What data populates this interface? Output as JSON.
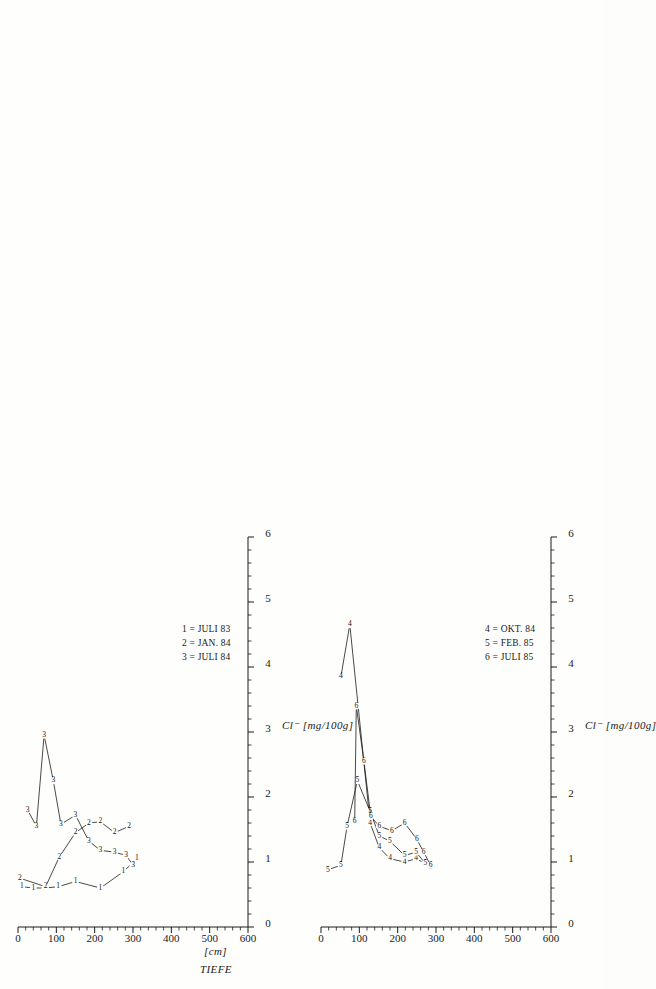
{
  "figure": {
    "orientation": "rotated-90-ccw",
    "background": "#fefefc",
    "ink": "#1a1a1a"
  },
  "axes_common": {
    "y_title": "TIEFE",
    "y_unit": "[cm]",
    "y_ticks": [
      "0",
      "100",
      "200",
      "300",
      "400",
      "500",
      "600"
    ],
    "y_min": 0,
    "y_max": 600,
    "x_title": "Cl⁻  [mg/100g]",
    "x_ticks": [
      "0",
      "1",
      "2",
      "3",
      "4",
      "5",
      "6"
    ],
    "x_min": 0,
    "x_max": 6
  },
  "chart_data": [
    {
      "id": "left",
      "type": "line",
      "title": "",
      "xlabel": "Cl⁻  [mg/100g]",
      "ylabel": "TIEFE [cm]",
      "xlim": [
        0,
        6
      ],
      "ylim": [
        0,
        600
      ],
      "y_inverted": true,
      "grid": false,
      "legend_position": "bottom-right",
      "legend": [
        {
          "key": "1",
          "label": "1 = JULI 83"
        },
        {
          "key": "2",
          "label": "2 = JAN. 84"
        },
        {
          "key": "3",
          "label": "3 = JULI 84"
        }
      ],
      "series": [
        {
          "name": "1 = JULI 83",
          "marker": "1",
          "points": [
            {
              "x": 0.62,
              "y": 10
            },
            {
              "x": 0.6,
              "y": 40
            },
            {
              "x": 0.6,
              "y": 70
            },
            {
              "x": 0.62,
              "y": 105
            },
            {
              "x": 0.7,
              "y": 150
            },
            {
              "x": 0.6,
              "y": 215
            },
            {
              "x": 0.85,
              "y": 275
            },
            {
              "x": 1.05,
              "y": 310
            }
          ]
        },
        {
          "name": "2 = JAN. 84",
          "marker": "2",
          "points": [
            {
              "x": 0.75,
              "y": 5
            },
            {
              "x": 0.62,
              "y": 72
            },
            {
              "x": 1.08,
              "y": 108
            },
            {
              "x": 1.45,
              "y": 150
            },
            {
              "x": 1.6,
              "y": 185
            },
            {
              "x": 1.62,
              "y": 215
            },
            {
              "x": 1.45,
              "y": 252
            },
            {
              "x": 1.55,
              "y": 290
            }
          ]
        },
        {
          "name": "3 = JULI 84",
          "marker": "3",
          "points": [
            {
              "x": 1.8,
              "y": 25
            },
            {
              "x": 1.55,
              "y": 48
            },
            {
              "x": 2.95,
              "y": 68
            },
            {
              "x": 2.25,
              "y": 92
            },
            {
              "x": 1.58,
              "y": 112
            },
            {
              "x": 1.72,
              "y": 150
            },
            {
              "x": 1.32,
              "y": 185
            },
            {
              "x": 1.18,
              "y": 215
            },
            {
              "x": 1.15,
              "y": 252
            },
            {
              "x": 1.1,
              "y": 282
            },
            {
              "x": 0.95,
              "y": 300
            }
          ]
        }
      ]
    },
    {
      "id": "right",
      "type": "line",
      "title": "",
      "xlabel": "Cl⁻  [mg/100g]",
      "ylabel": "TIEFE [cm]",
      "xlim": [
        0,
        6
      ],
      "ylim": [
        0,
        600
      ],
      "y_inverted": true,
      "grid": false,
      "legend_position": "bottom-right",
      "legend": [
        {
          "key": "4",
          "label": "4 = OKT. 84"
        },
        {
          "key": "5",
          "label": "5 = FEB. 85"
        },
        {
          "key": "6",
          "label": "6 = JULI 85"
        }
      ],
      "series": [
        {
          "name": "4 = OKT. 84",
          "marker": "4",
          "points": [
            {
              "x": 3.85,
              "y": 52
            },
            {
              "x": 4.65,
              "y": 75
            },
            {
              "x": 1.6,
              "y": 128
            },
            {
              "x": 1.22,
              "y": 152
            },
            {
              "x": 1.05,
              "y": 180
            },
            {
              "x": 1.0,
              "y": 218
            },
            {
              "x": 1.05,
              "y": 248
            },
            {
              "x": 0.98,
              "y": 270
            },
            {
              "x": 0.95,
              "y": 285
            }
          ]
        },
        {
          "name": "5 = FEB. 85",
          "marker": "5",
          "points": [
            {
              "x": 0.88,
              "y": 18
            },
            {
              "x": 0.95,
              "y": 52
            },
            {
              "x": 1.55,
              "y": 68
            },
            {
              "x": 2.25,
              "y": 95
            },
            {
              "x": 1.78,
              "y": 128
            },
            {
              "x": 1.4,
              "y": 152
            },
            {
              "x": 1.32,
              "y": 180
            },
            {
              "x": 1.1,
              "y": 218
            },
            {
              "x": 1.15,
              "y": 248
            },
            {
              "x": 0.98,
              "y": 272
            },
            {
              "x": 0.92,
              "y": 286
            }
          ]
        },
        {
          "name": "6 = JULI 85",
          "marker": "6",
          "points": [
            {
              "x": 1.62,
              "y": 88
            },
            {
              "x": 3.4,
              "y": 92
            },
            {
              "x": 2.55,
              "y": 112
            },
            {
              "x": 1.7,
              "y": 130
            },
            {
              "x": 1.55,
              "y": 152
            },
            {
              "x": 1.48,
              "y": 185
            },
            {
              "x": 1.6,
              "y": 218
            },
            {
              "x": 1.35,
              "y": 250
            },
            {
              "x": 1.15,
              "y": 268
            },
            {
              "x": 0.95,
              "y": 286
            }
          ]
        }
      ]
    }
  ]
}
